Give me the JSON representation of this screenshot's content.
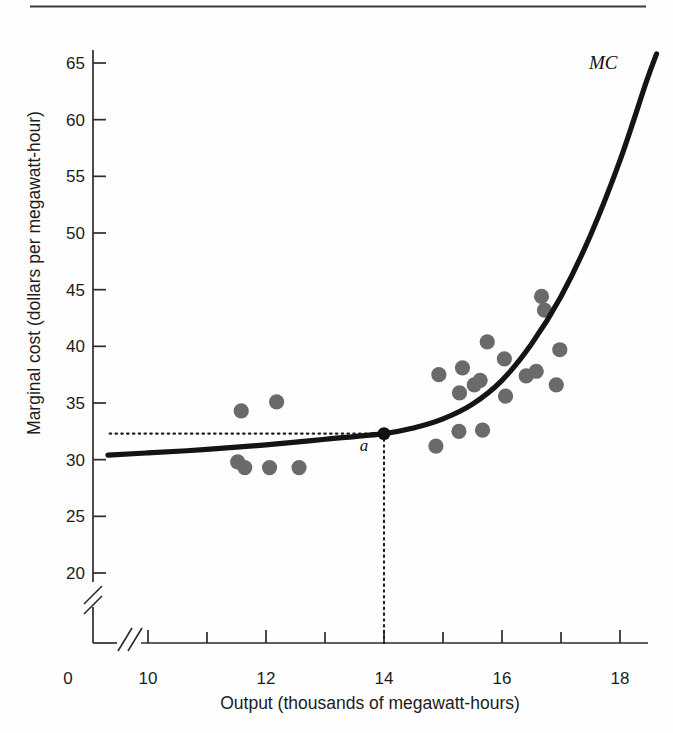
{
  "figure": {
    "has_top_rule": true,
    "background_color": "#fefefe"
  },
  "chart_data": {
    "type": "scatter",
    "title": "",
    "subtitle": "",
    "xlabel": "Output (thousands of megawatt-hours)",
    "ylabel": "Marginal cost (dollars per megawatt-hour)",
    "xlim": [
      9.3,
      18.7
    ],
    "ylim": [
      18.5,
      66.5
    ],
    "x_ticks": [
      10,
      12,
      14,
      16,
      18
    ],
    "x_tick_labels": [
      "10",
      "12",
      "14",
      "16",
      "18"
    ],
    "x_minor_ticks": [
      11,
      13,
      15,
      17
    ],
    "x_origin_label": "0",
    "y_ticks": [
      20,
      25,
      30,
      35,
      40,
      45,
      50,
      55,
      60,
      65
    ],
    "y_tick_labels": [
      "20",
      "25",
      "30",
      "35",
      "40",
      "45",
      "50",
      "55",
      "60",
      "65"
    ],
    "axis_break_x": true,
    "axis_break_y": true,
    "grid": false,
    "legend": "none",
    "series": [
      {
        "name": "observed cost data",
        "type": "scatter",
        "marker": "filled-circle",
        "color": "#6a6a6a",
        "points": [
          {
            "x": 11.58,
            "y": 34.3
          },
          {
            "x": 12.18,
            "y": 35.1
          },
          {
            "x": 11.52,
            "y": 29.8
          },
          {
            "x": 11.64,
            "y": 29.3
          },
          {
            "x": 12.06,
            "y": 29.3
          },
          {
            "x": 12.56,
            "y": 29.3
          },
          {
            "x": 14.88,
            "y": 31.2
          },
          {
            "x": 15.27,
            "y": 32.5
          },
          {
            "x": 15.67,
            "y": 32.6
          },
          {
            "x": 14.93,
            "y": 37.5
          },
          {
            "x": 15.28,
            "y": 35.9
          },
          {
            "x": 15.53,
            "y": 36.6
          },
          {
            "x": 15.33,
            "y": 38.1
          },
          {
            "x": 15.63,
            "y": 37.0
          },
          {
            "x": 15.75,
            "y": 40.4
          },
          {
            "x": 16.04,
            "y": 38.9
          },
          {
            "x": 16.06,
            "y": 35.6
          },
          {
            "x": 16.41,
            "y": 37.4
          },
          {
            "x": 16.67,
            "y": 44.4
          },
          {
            "x": 16.72,
            "y": 43.2
          },
          {
            "x": 16.58,
            "y": 37.8
          },
          {
            "x": 16.98,
            "y": 39.7
          },
          {
            "x": 16.92,
            "y": 36.6
          }
        ]
      },
      {
        "name": "MC",
        "type": "line",
        "label": "MC",
        "color": "#141414",
        "description": "marginal cost curve, flat near 30.5 then rising steeply",
        "points": [
          {
            "x": 9.32,
            "y": 30.4
          },
          {
            "x": 10.0,
            "y": 30.6
          },
          {
            "x": 11.0,
            "y": 30.9
          },
          {
            "x": 12.0,
            "y": 31.3
          },
          {
            "x": 13.0,
            "y": 31.8
          },
          {
            "x": 14.0,
            "y": 32.3
          },
          {
            "x": 14.5,
            "y": 32.8
          },
          {
            "x": 15.0,
            "y": 33.6
          },
          {
            "x": 15.5,
            "y": 34.9
          },
          {
            "x": 16.0,
            "y": 37.0
          },
          {
            "x": 16.5,
            "y": 40.2
          },
          {
            "x": 17.0,
            "y": 44.4
          },
          {
            "x": 17.5,
            "y": 49.8
          },
          {
            "x": 18.0,
            "y": 56.4
          },
          {
            "x": 18.45,
            "y": 63.4
          },
          {
            "x": 18.62,
            "y": 65.8
          }
        ]
      }
    ],
    "annotations": [
      {
        "name": "tangency-point",
        "label": "a",
        "x": 14.0,
        "y": 32.3,
        "marker": "filled-circle",
        "color": "#111111"
      },
      {
        "name": "horizontal-guide",
        "type": "dotted-line",
        "from": {
          "x": 9.35,
          "y": 32.3
        },
        "to": {
          "x": 14.0,
          "y": 32.3
        }
      },
      {
        "name": "vertical-guide",
        "type": "dotted-line",
        "from": {
          "x": 14.0,
          "y": 32.3
        },
        "to": {
          "x": 14.0,
          "y": 18.5
        }
      }
    ]
  }
}
